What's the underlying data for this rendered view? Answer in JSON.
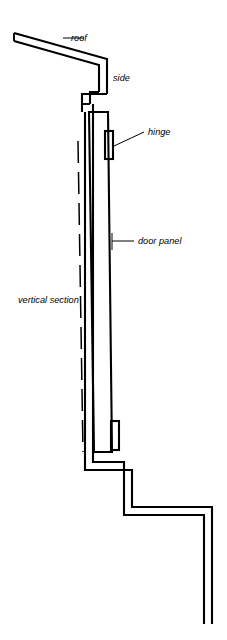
{
  "figure": {
    "kind": "architectural-section-drawing",
    "title_label": "vertical section",
    "stroke_color": "#000000",
    "background_color": "#ffffff",
    "width_px": 227,
    "height_px": 640
  },
  "labels": {
    "roof": "roof",
    "side": "side",
    "hinge": "hinge",
    "door_panel": "door panel",
    "vertical_section": "vertical section"
  },
  "parts": [
    {
      "name": "roof",
      "label": "roof",
      "description": "double-line sloping eaves at top left"
    },
    {
      "name": "side",
      "label": "side",
      "description": "vertical double-line wall below roof"
    },
    {
      "name": "hinge-upper",
      "label": "hinge",
      "description": "small rectangle on right edge near door top"
    },
    {
      "name": "hinge-lower",
      "label": "hinge",
      "description": "small rectangle on right edge near door bottom"
    },
    {
      "name": "door-panel",
      "label": "door panel",
      "description": "long narrow vertical double-line panel, slightly tapered"
    },
    {
      "name": "sill-step",
      "label": "",
      "description": "stepped double-line threshold at bottom"
    },
    {
      "name": "swing-line",
      "label": "",
      "description": "dashed line indicating door swing / alignment"
    }
  ],
  "geometry": {
    "roof": {
      "outer": "M 14,33 L 107,59 L 107,95",
      "inner": "M 14,41 L 99,64 L 99,92"
    },
    "side": {
      "outer": "M 107,95 L 83,95 L 83,104",
      "inner": "M 99,92 L 91,92"
    },
    "door_panel": {
      "left_edge": "M 89,113 L 95,452",
      "right_edge": "M 108,112 L 112,452",
      "top_edge": "M 89,113 L 108,112",
      "bottom_edge": "M 95,452 L 112,452"
    },
    "hinge_upper": {
      "x": 104,
      "y": 131,
      "w": 8,
      "h": 28
    },
    "hinge_lower": {
      "x": 112,
      "y": 421,
      "w": 8,
      "h": 29
    },
    "dashed_swing": "M 79,140 L 84,452",
    "sill": {
      "outer": "M 86,104 L 86,470 L 131,470 L 131,506 L 211,506 L 211,622",
      "inner": "M 94,104 L 94,462 L 123,462 L 123,514 L 203,514 L 203,622"
    }
  },
  "leaders": {
    "roof": {
      "from": [
        82,
        38
      ],
      "to": [
        63,
        38
      ]
    },
    "hinge": {
      "from": [
        113,
        146
      ],
      "to": [
        143,
        133
      ]
    },
    "door_panel": {
      "from": [
        112,
        241
      ],
      "to": [
        133,
        241
      ]
    },
    "door_panel_tick": {
      "from": [
        112,
        234
      ],
      "to": [
        112,
        249
      ]
    }
  },
  "label_positions": {
    "roof": {
      "x": 71,
      "y": 38
    },
    "side": {
      "x": 113,
      "y": 78
    },
    "hinge": {
      "x": 148,
      "y": 133
    },
    "door_panel": {
      "x": 137,
      "y": 244
    },
    "vertical_section": {
      "x": 18,
      "y": 300
    }
  }
}
